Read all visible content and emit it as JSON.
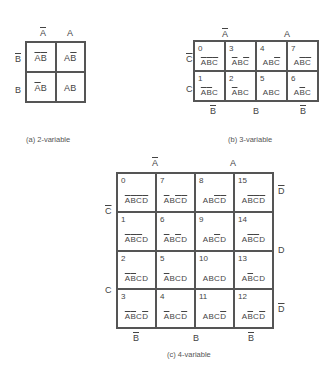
{
  "map2": {
    "col_labels": [
      {
        "text": "A",
        "bar": true
      },
      {
        "text": "A",
        "bar": false
      }
    ],
    "row_labels": [
      {
        "text": "B",
        "bar": true
      },
      {
        "text": "B",
        "bar": false
      }
    ],
    "cells": [
      [
        [
          {
            "t": "A",
            "b": true
          },
          {
            "t": "B",
            "b": true
          }
        ],
        [
          {
            "t": "A",
            "b": false
          },
          {
            "t": "B",
            "b": true
          }
        ]
      ],
      [
        [
          {
            "t": "A",
            "b": true
          },
          {
            "t": "B",
            "b": false
          }
        ],
        [
          {
            "t": "A",
            "b": false
          },
          {
            "t": "B",
            "b": false
          }
        ]
      ]
    ],
    "caption": "(a) 2-variable"
  },
  "map3": {
    "col_labels": [
      {
        "text": "A",
        "bar": true
      },
      {
        "text": "A",
        "bar": false
      }
    ],
    "row_labels": [
      {
        "text": "C",
        "bar": true
      },
      {
        "text": "C",
        "bar": false
      }
    ],
    "bottom_labels": [
      {
        "text": "B",
        "bar": true
      },
      {
        "text": "B",
        "bar": false
      },
      {
        "text": "B",
        "bar": true
      }
    ],
    "cells": [
      [
        {
          "num": "0",
          "term": [
            {
              "t": "A",
              "b": true
            },
            {
              "t": "B",
              "b": true
            },
            {
              "t": "C",
              "b": true
            }
          ]
        },
        {
          "num": "3",
          "term": [
            {
              "t": "A",
              "b": true
            },
            {
              "t": "B",
              "b": false
            },
            {
              "t": "C",
              "b": true
            }
          ]
        },
        {
          "num": "4",
          "term": [
            {
              "t": "A",
              "b": false
            },
            {
              "t": "B",
              "b": false
            },
            {
              "t": "C",
              "b": true
            }
          ]
        },
        {
          "num": "7",
          "term": [
            {
              "t": "A",
              "b": false
            },
            {
              "t": "B",
              "b": true
            },
            {
              "t": "C",
              "b": true
            }
          ]
        }
      ],
      [
        {
          "num": "1",
          "term": [
            {
              "t": "A",
              "b": true
            },
            {
              "t": "B",
              "b": true
            },
            {
              "t": "C",
              "b": false
            }
          ]
        },
        {
          "num": "2",
          "term": [
            {
              "t": "A",
              "b": true
            },
            {
              "t": "B",
              "b": false
            },
            {
              "t": "C",
              "b": false
            }
          ]
        },
        {
          "num": "5",
          "term": [
            {
              "t": "A",
              "b": false
            },
            {
              "t": "B",
              "b": false
            },
            {
              "t": "C",
              "b": false
            }
          ]
        },
        {
          "num": "6",
          "term": [
            {
              "t": "A",
              "b": false
            },
            {
              "t": "B",
              "b": true
            },
            {
              "t": "C",
              "b": false
            }
          ]
        }
      ]
    ],
    "caption": "(b) 3-variable"
  },
  "map4": {
    "col_labels": [
      {
        "text": "A",
        "bar": true
      },
      {
        "text": "A",
        "bar": false
      }
    ],
    "left_labels": [
      {
        "text": "C",
        "bar": true
      },
      {
        "text": "C",
        "bar": false
      }
    ],
    "right_labels": [
      {
        "text": "D",
        "bar": true
      },
      {
        "text": "D",
        "bar": false
      },
      {
        "text": "D",
        "bar": true
      }
    ],
    "bottom_labels": [
      {
        "text": "B",
        "bar": true
      },
      {
        "text": "B",
        "bar": false
      },
      {
        "text": "B",
        "bar": true
      }
    ],
    "cells": [
      [
        {
          "num": "0",
          "term": [
            {
              "t": "A",
              "b": true
            },
            {
              "t": "B",
              "b": true
            },
            {
              "t": "C",
              "b": true
            },
            {
              "t": "D",
              "b": true
            }
          ]
        },
        {
          "num": "7",
          "term": [
            {
              "t": "A",
              "b": true
            },
            {
              "t": "B",
              "b": false
            },
            {
              "t": "C",
              "b": true
            },
            {
              "t": "D",
              "b": true
            }
          ]
        },
        {
          "num": "8",
          "term": [
            {
              "t": "A",
              "b": false
            },
            {
              "t": "B",
              "b": false
            },
            {
              "t": "C",
              "b": true
            },
            {
              "t": "D",
              "b": true
            }
          ]
        },
        {
          "num": "15",
          "term": [
            {
              "t": "A",
              "b": false
            },
            {
              "t": "B",
              "b": true
            },
            {
              "t": "C",
              "b": true
            },
            {
              "t": "D",
              "b": true
            }
          ]
        }
      ],
      [
        {
          "num": "1",
          "term": [
            {
              "t": "A",
              "b": true
            },
            {
              "t": "B",
              "b": true
            },
            {
              "t": "C",
              "b": true
            },
            {
              "t": "D",
              "b": false
            }
          ]
        },
        {
          "num": "6",
          "term": [
            {
              "t": "A",
              "b": true
            },
            {
              "t": "B",
              "b": false
            },
            {
              "t": "C",
              "b": true
            },
            {
              "t": "D",
              "b": false
            }
          ]
        },
        {
          "num": "9",
          "term": [
            {
              "t": "A",
              "b": false
            },
            {
              "t": "B",
              "b": false
            },
            {
              "t": "C",
              "b": true
            },
            {
              "t": "D",
              "b": false
            }
          ]
        },
        {
          "num": "14",
          "term": [
            {
              "t": "A",
              "b": false
            },
            {
              "t": "B",
              "b": true
            },
            {
              "t": "C",
              "b": true
            },
            {
              "t": "D",
              "b": false
            }
          ]
        }
      ],
      [
        {
          "num": "2",
          "term": [
            {
              "t": "A",
              "b": true
            },
            {
              "t": "B",
              "b": true
            },
            {
              "t": "C",
              "b": false
            },
            {
              "t": "D",
              "b": false
            }
          ]
        },
        {
          "num": "5",
          "term": [
            {
              "t": "A",
              "b": true
            },
            {
              "t": "B",
              "b": false
            },
            {
              "t": "C",
              "b": false
            },
            {
              "t": "D",
              "b": false
            }
          ]
        },
        {
          "num": "10",
          "term": [
            {
              "t": "A",
              "b": false
            },
            {
              "t": "B",
              "b": false
            },
            {
              "t": "C",
              "b": false
            },
            {
              "t": "D",
              "b": false
            }
          ]
        },
        {
          "num": "13",
          "term": [
            {
              "t": "A",
              "b": false
            },
            {
              "t": "B",
              "b": true
            },
            {
              "t": "C",
              "b": false
            },
            {
              "t": "D",
              "b": false
            }
          ]
        }
      ],
      [
        {
          "num": "3",
          "term": [
            {
              "t": "A",
              "b": true
            },
            {
              "t": "B",
              "b": true
            },
            {
              "t": "C",
              "b": false
            },
            {
              "t": "D",
              "b": true
            }
          ]
        },
        {
          "num": "4",
          "term": [
            {
              "t": "A",
              "b": true
            },
            {
              "t": "B",
              "b": false
            },
            {
              "t": "C",
              "b": false
            },
            {
              "t": "D",
              "b": true
            }
          ]
        },
        {
          "num": "11",
          "term": [
            {
              "t": "A",
              "b": false
            },
            {
              "t": "B",
              "b": false
            },
            {
              "t": "C",
              "b": false
            },
            {
              "t": "D",
              "b": true
            }
          ]
        },
        {
          "num": "12",
          "term": [
            {
              "t": "A",
              "b": false
            },
            {
              "t": "B",
              "b": true
            },
            {
              "t": "C",
              "b": false
            },
            {
              "t": "D",
              "b": true
            }
          ]
        }
      ]
    ],
    "caption": "(c) 4-variable"
  }
}
